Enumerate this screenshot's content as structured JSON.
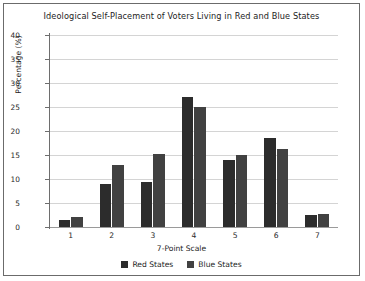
{
  "chart_data": {
    "type": "bar",
    "title": "Ideological Self-Placement of Voters Living in Red and Blue States",
    "xlabel": "7-Point Scale",
    "ylabel": "Percentage (%)",
    "categories": [
      "1",
      "2",
      "3",
      "4",
      "5",
      "6",
      "7"
    ],
    "series": [
      {
        "name": "Red States",
        "color": "#2c2c2c",
        "values": [
          1.5,
          9.0,
          9.3,
          27.0,
          14.0,
          18.5,
          2.5
        ]
      },
      {
        "name": "Blue States",
        "color": "#414141",
        "values": [
          2.0,
          13.0,
          15.3,
          25.0,
          15.0,
          16.3,
          2.8
        ]
      }
    ],
    "ylim": [
      0,
      40
    ],
    "yticks": [
      0,
      5,
      10,
      15,
      20,
      25,
      30,
      35,
      40
    ],
    "ytick_labels": [
      "0",
      "5",
      "10",
      "15",
      "20",
      "25",
      "30",
      "35",
      "40"
    ],
    "grid": true,
    "legend_position": "bottom"
  }
}
